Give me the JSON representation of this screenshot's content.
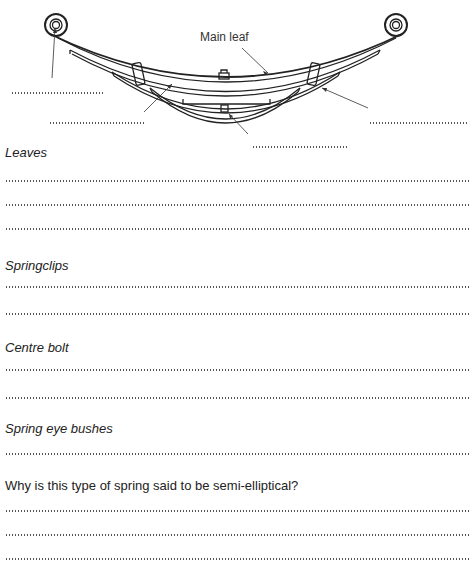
{
  "diagram": {
    "labels": {
      "main_leaf": "Main leaf"
    },
    "blanks": [
      {
        "id": "spring-eye-bush-blank",
        "points_to": "spring eye"
      },
      {
        "id": "leaves-blank",
        "points_to": "leaves"
      },
      {
        "id": "centre-bolt-blank",
        "points_to": "centre bolt"
      },
      {
        "id": "springclip-blank",
        "points_to": "spring clip"
      }
    ]
  },
  "sections": [
    {
      "heading": "Leaves",
      "answer_lines": 3
    },
    {
      "heading": "Springclips",
      "answer_lines": 2
    },
    {
      "heading": "Centre bolt",
      "answer_lines": 2
    },
    {
      "heading": "Spring eye bushes",
      "answer_lines": 1
    }
  ],
  "question": {
    "text": "Why is this type of spring said to be semi-elliptical?",
    "answer_lines": 3
  }
}
